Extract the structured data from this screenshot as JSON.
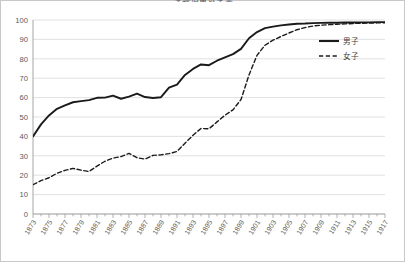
{
  "chart": {
    "title": "学齢児童就学率",
    "legend_position": "inside-right-top"
  },
  "chart_data": {
    "type": "line",
    "title": "学齢児童就学率",
    "xlabel": "",
    "ylabel": "",
    "ylim": [
      0,
      100
    ],
    "yticks": [
      0,
      10,
      20,
      30,
      40,
      50,
      60,
      70,
      80,
      90,
      100
    ],
    "grid": true,
    "xlim": [
      1873,
      1917
    ],
    "categories": [
      1873,
      1874,
      1875,
      1876,
      1877,
      1878,
      1879,
      1880,
      1881,
      1882,
      1883,
      1884,
      1885,
      1886,
      1887,
      1888,
      1889,
      1890,
      1891,
      1892,
      1893,
      1894,
      1895,
      1896,
      1897,
      1898,
      1899,
      1900,
      1901,
      1902,
      1903,
      1904,
      1905,
      1906,
      1907,
      1908,
      1909,
      1910,
      1911,
      1912,
      1913,
      1914,
      1915,
      1916,
      1917
    ],
    "tick_labels": [
      "1873",
      "1875",
      "1877",
      "1879",
      "1881",
      "1883",
      "1885",
      "1887",
      "1889",
      "1891",
      "1893",
      "1895",
      "1897",
      "1899",
      "1901",
      "1903",
      "1905",
      "1907",
      "1909",
      "1911",
      "1913",
      "1915",
      "1917"
    ],
    "series": [
      {
        "name": "男子",
        "style": "solid",
        "color": "#1a1a1a",
        "values": [
          39.9,
          46.2,
          50.8,
          54.2,
          56.0,
          57.6,
          58.2,
          58.7,
          59.9,
          60.0,
          61.0,
          59.4,
          60.5,
          62.0,
          60.3,
          59.8,
          60.2,
          65.1,
          66.7,
          71.7,
          74.8,
          77.1,
          76.7,
          79.0,
          80.7,
          82.4,
          85.1,
          90.6,
          93.8,
          95.8,
          96.6,
          97.2,
          97.7,
          98.1,
          98.2,
          98.4,
          98.5,
          98.6,
          98.6,
          98.7,
          98.7,
          98.8,
          98.8,
          98.9,
          98.9
        ]
      },
      {
        "name": "女子",
        "style": "dashed",
        "color": "#1a1a1a",
        "values": [
          15.1,
          17.2,
          18.7,
          21.0,
          22.5,
          23.5,
          22.6,
          21.9,
          24.7,
          27.2,
          28.8,
          29.6,
          31.2,
          29.0,
          28.3,
          30.2,
          30.5,
          31.1,
          32.2,
          36.5,
          40.6,
          44.1,
          43.9,
          47.5,
          50.9,
          53.7,
          59.0,
          71.7,
          81.8,
          87.0,
          89.6,
          91.5,
          93.3,
          95.0,
          96.1,
          96.9,
          97.3,
          97.6,
          97.8,
          98.0,
          98.2,
          98.3,
          98.4,
          98.5,
          98.6
        ]
      }
    ],
    "legend": [
      "男子",
      "女子"
    ]
  }
}
